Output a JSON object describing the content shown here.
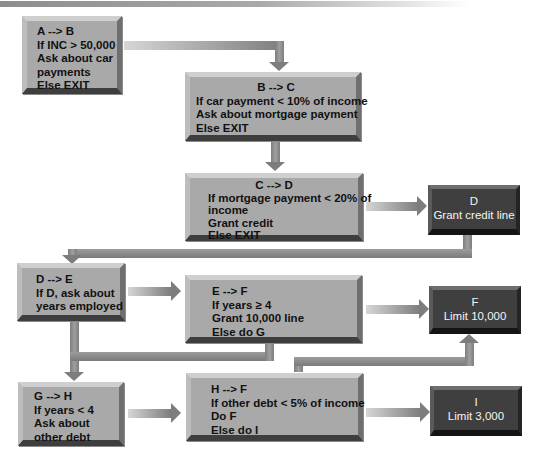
{
  "diagram": {
    "type": "flowchart",
    "nodes": {
      "a": {
        "id": "A",
        "lines": [
          "A --> B",
          "If INC > 50,000",
          "Ask about car",
          "payments",
          "Else EXIT"
        ]
      },
      "b": {
        "id": "B",
        "lines": [
          "B --> C",
          "If car payment < 10% of income",
          "Ask about mortgage payment",
          "Else EXIT"
        ]
      },
      "c": {
        "id": "C",
        "lines": [
          "C --> D",
          "If mortgage payment < 20% of",
          "income",
          "Grant credit",
          "Else EXIT"
        ]
      },
      "d": {
        "id": "D",
        "lines": [
          "D",
          "Grant credit line"
        ]
      },
      "e": {
        "id": "D-E",
        "lines": [
          "D --> E",
          "If D, ask about",
          "years employed"
        ]
      },
      "ef": {
        "id": "E-F",
        "lines": [
          "E --> F",
          "If years ≥ 4",
          "Grant 10,000 line",
          "Else do G"
        ]
      },
      "f": {
        "id": "F",
        "lines": [
          "F",
          "Limit 10,000"
        ]
      },
      "g": {
        "id": "G-H",
        "lines": [
          "G --> H",
          "If years < 4",
          "Ask about",
          "other debt"
        ]
      },
      "h": {
        "id": "H-F",
        "lines": [
          "H --> F",
          "If other debt < 5% of income",
          "Do F",
          "Else do I"
        ]
      },
      "i": {
        "id": "I",
        "lines": [
          "I",
          "Limit 3,000"
        ]
      }
    },
    "edges": [
      [
        "A",
        "B"
      ],
      [
        "B",
        "C"
      ],
      [
        "C",
        "D"
      ],
      [
        "D",
        "D-E"
      ],
      [
        "D-E",
        "E-F"
      ],
      [
        "E-F",
        "F"
      ],
      [
        "D-E",
        "G-H"
      ],
      [
        "E-F",
        "G-H"
      ],
      [
        "G-H",
        "H-F"
      ],
      [
        "H-F",
        "F"
      ],
      [
        "H-F",
        "I"
      ]
    ],
    "colors": {
      "light_box": "#a9a9a9",
      "dark_box": "#3f3f3f",
      "connector": "#7d7d7d",
      "background": "#ffffff"
    }
  }
}
